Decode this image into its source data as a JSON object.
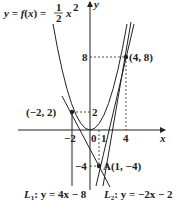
{
  "diagram": {
    "function_label": "y = f(x) = ",
    "function_frac_num": "1",
    "function_frac_den": "2",
    "function_tail": "x",
    "function_exp": "2",
    "axis_x": "x",
    "axis_y": "y",
    "points": [
      {
        "name": "P1",
        "label": "(4, 8)",
        "x": 4,
        "y": 8
      },
      {
        "name": "P2",
        "label": "(−2, 2)",
        "x": -2,
        "y": 2
      },
      {
        "name": "A",
        "label": "A(1, −4)",
        "x": 1,
        "y": -4
      }
    ],
    "ticks": {
      "y8": "8",
      "y2": "2",
      "yneg4": "−4",
      "xneg2": "−2",
      "x0": "0",
      "x1": "1",
      "x4": "4"
    },
    "lines": {
      "L1": {
        "label_name": "L",
        "label_sub": "1",
        "label_eq": ": y = 4x − 8"
      },
      "L2": {
        "label_name": "L",
        "label_sub": "2",
        "label_eq": ": y = −2x − 2"
      }
    },
    "colors": {
      "stroke": "#222222",
      "background": "#ffffff"
    }
  }
}
